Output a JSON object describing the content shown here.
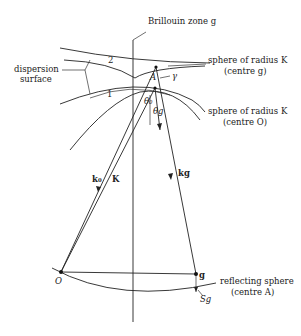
{
  "diagram": {
    "labels": {
      "brillouin_zone": "Brillouin zone g",
      "dispersion_surface_line1": "dispersion",
      "dispersion_surface_line2": "surface",
      "branch_2": "2",
      "branch_1": "1",
      "sphere_g_line1": "sphere of radius K",
      "sphere_g_line2": "(centre g)",
      "sphere_o_line1": "sphere of radius K",
      "sphere_o_line2": "(centre O)",
      "gamma": "γ",
      "tie_point": "A",
      "theta_0": "θ₀",
      "theta_g": "θg",
      "k0": "k₀",
      "K": "K",
      "kg": "kg",
      "origin": "O",
      "g_point": "g",
      "reflecting_sphere_line1": "reflecting sphere",
      "reflecting_sphere_line2": "(centre A)",
      "sg": "Sg"
    },
    "points": {
      "O": [
        61,
        272
      ],
      "g": [
        196,
        274
      ],
      "A": [
        156,
        67
      ],
      "tie": [
        155,
        88
      ]
    }
  }
}
